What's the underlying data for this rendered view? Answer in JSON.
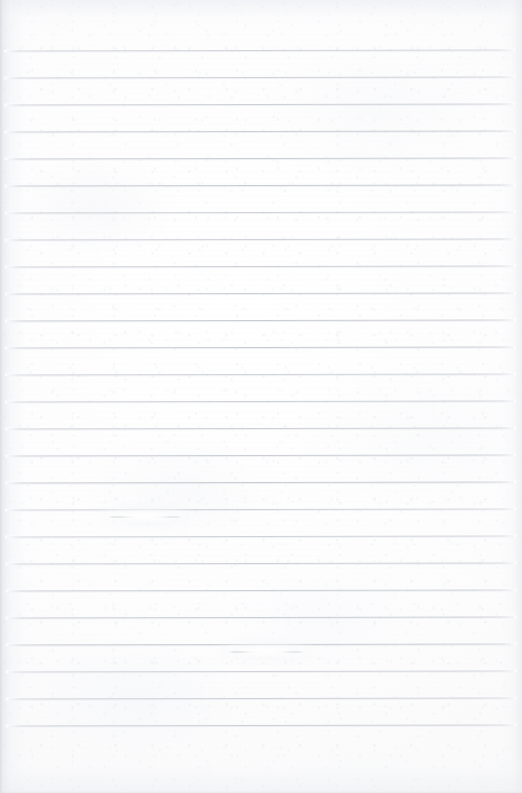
{
  "document": {
    "kind": "scanned-lined-notebook-page",
    "title": "Blank Ruled Notebook Page",
    "written_content": "",
    "has_text": false,
    "page_width": 522,
    "page_height": 793
  },
  "paper": {
    "background_color": "#fdfdfd",
    "tint_color": "#f5f6f7",
    "edge_shadow_color": "#d6d9de",
    "texture": "fibrous scan grain with mottled illumination"
  },
  "rules": {
    "line_color": "#c6cad1",
    "line_thickness_px": 1,
    "spacing_px": 27,
    "left_x": 7,
    "right_x": 514,
    "first_line_y": 50,
    "count": 26,
    "skew_degrees": -0.13,
    "y_positions": [
      50,
      77,
      104,
      131,
      158,
      185,
      212,
      239,
      266,
      293,
      320,
      347,
      374,
      401,
      428,
      455,
      482,
      509,
      536,
      563,
      590,
      617,
      644,
      671,
      698,
      725
    ]
  },
  "marks": [
    {
      "name": "erasure-smudge-upper",
      "description": "faint erased pencil stroke interrupting a ruled line",
      "x": 108,
      "y": 509,
      "width": 74,
      "height": 14
    },
    {
      "name": "erasure-smudge-lower",
      "description": "faint erased pencil stroke interrupting a ruled line",
      "x": 228,
      "y": 644,
      "width": 76,
      "height": 14
    }
  ],
  "margins": {
    "top_blank_px": 50,
    "bottom_blank_px": 55,
    "left_blank_px": 7,
    "right_blank_px": 8
  }
}
